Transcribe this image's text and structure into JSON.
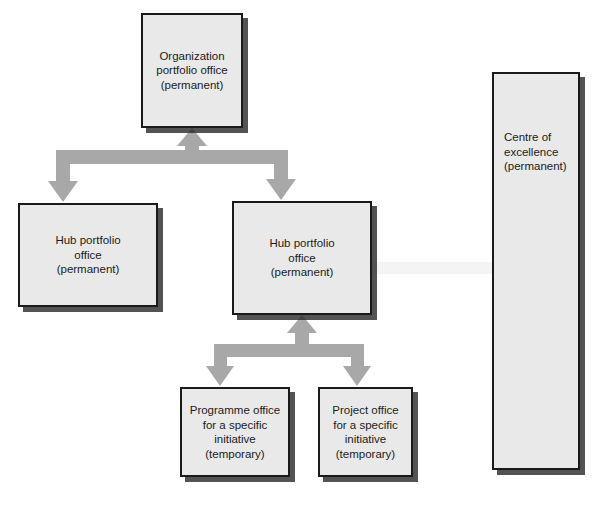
{
  "diagram": {
    "colors": {
      "box_fill": "#e9e9e9",
      "box_border": "#1a1a1a",
      "box_shadow": "#282828",
      "arrow_fill": "#a8a8a8",
      "text": "#1b1b1b",
      "background": "#ffffff"
    },
    "nodes": [
      {
        "id": "organization-portfolio-office",
        "label": "Organization\nportfolio office\n(permanent)",
        "kind": "permanent",
        "x": 141,
        "y": 13,
        "w": 102,
        "h": 115
      },
      {
        "id": "hub-portfolio-office-left",
        "label": "Hub portfolio\noffice\n(permanent)",
        "kind": "permanent",
        "x": 18,
        "y": 203,
        "w": 140,
        "h": 104
      },
      {
        "id": "hub-portfolio-office-right",
        "label": "Hub portfolio\noffice\n(permanent)",
        "kind": "permanent",
        "x": 232,
        "y": 201,
        "w": 140,
        "h": 114
      },
      {
        "id": "programme-office",
        "label": "Programme office\nfor a specific\ninitiative\n(temporary)",
        "kind": "temporary",
        "x": 180,
        "y": 387,
        "w": 110,
        "h": 90
      },
      {
        "id": "project-office",
        "label": "Project office\nfor a specific\ninitiative\n(temporary)",
        "kind": "temporary",
        "x": 318,
        "y": 387,
        "w": 95,
        "h": 90
      },
      {
        "id": "centre-of-excellence",
        "label": "Centre of\nexcellence\n(permanent)",
        "kind": "permanent",
        "x": 492,
        "y": 72,
        "w": 88,
        "h": 398
      }
    ],
    "connectors": [
      {
        "id": "org-to-hubs",
        "from": "organization-portfolio-office",
        "to": [
          "hub-portfolio-office-left",
          "hub-portfolio-office-right"
        ],
        "style": "block-arrow-fork-up-and-down"
      },
      {
        "id": "hub-to-offices",
        "from": "hub-portfolio-office-right",
        "to": [
          "programme-office",
          "project-office"
        ],
        "style": "block-arrow-fork-up-and-down"
      }
    ],
    "caption": {
      "text": "",
      "visible": false
    }
  }
}
